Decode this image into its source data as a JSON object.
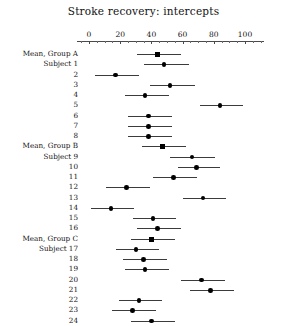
{
  "chart_data": {
    "type": "scatter",
    "title": "Stroke recovery: intercepts",
    "xlabel": "",
    "ylabel": "",
    "xlim": [
      -8,
      112
    ],
    "grid": false,
    "legend": null,
    "axis": {
      "ticks": [
        0,
        20,
        40,
        60,
        80,
        100
      ],
      "tick_labels": [
        "0",
        "20",
        "40",
        "60",
        "80",
        "100"
      ],
      "minor_tick_step": 5,
      "position": "top"
    },
    "marker_styles": {
      "mean": "square",
      "subject": "circle"
    },
    "rows": [
      {
        "label": "Mean, Group A",
        "type": "mean",
        "estimate": 44.0,
        "low": 31.0,
        "high": 59.0
      },
      {
        "label": "Subject 1",
        "type": "subject",
        "estimate": 48.0,
        "low": 35.0,
        "high": 64.0
      },
      {
        "label": "2",
        "type": "subject",
        "estimate": 17.0,
        "low": 4.0,
        "high": 32.0
      },
      {
        "label": "3",
        "type": "subject",
        "estimate": 52.0,
        "low": 39.0,
        "high": 68.0
      },
      {
        "label": "4",
        "type": "subject",
        "estimate": 36.0,
        "low": 23.0,
        "high": 51.0
      },
      {
        "label": "5",
        "type": "subject",
        "estimate": 84.0,
        "low": 71.0,
        "high": 99.0
      },
      {
        "label": "6",
        "type": "subject",
        "estimate": 38.0,
        "low": 25.0,
        "high": 53.0
      },
      {
        "label": "7",
        "type": "subject",
        "estimate": 38.0,
        "low": 25.0,
        "high": 53.0
      },
      {
        "label": "8",
        "type": "subject",
        "estimate": 38.0,
        "low": 25.0,
        "high": 53.0
      },
      {
        "label": "Mean, Group B",
        "type": "mean",
        "estimate": 47.0,
        "low": 34.0,
        "high": 62.0
      },
      {
        "label": "Subject 9",
        "type": "subject",
        "estimate": 66.0,
        "low": 52.0,
        "high": 81.0
      },
      {
        "label": "10",
        "type": "subject",
        "estimate": 69.0,
        "low": 57.0,
        "high": 84.0
      },
      {
        "label": "11",
        "type": "subject",
        "estimate": 54.0,
        "low": 41.0,
        "high": 69.0
      },
      {
        "label": "12",
        "type": "subject",
        "estimate": 24.0,
        "low": 11.0,
        "high": 39.0
      },
      {
        "label": "13",
        "type": "subject",
        "estimate": 73.0,
        "low": 60.0,
        "high": 88.0
      },
      {
        "label": "14",
        "type": "subject",
        "estimate": 14.0,
        "low": 1.0,
        "high": 29.0
      },
      {
        "label": "15",
        "type": "subject",
        "estimate": 41.0,
        "low": 28.0,
        "high": 56.0
      },
      {
        "label": "16",
        "type": "subject",
        "estimate": 44.0,
        "low": 31.0,
        "high": 59.0
      },
      {
        "label": "Mean, Group C",
        "type": "mean",
        "estimate": 40.0,
        "low": 27.0,
        "high": 55.0
      },
      {
        "label": "Subject 17",
        "type": "subject",
        "estimate": 30.0,
        "low": 17.0,
        "high": 45.0
      },
      {
        "label": "18",
        "type": "subject",
        "estimate": 35.0,
        "low": 22.0,
        "high": 50.0
      },
      {
        "label": "19",
        "type": "subject",
        "estimate": 36.0,
        "low": 23.0,
        "high": 51.0
      },
      {
        "label": "20",
        "type": "subject",
        "estimate": 72.0,
        "low": 59.0,
        "high": 87.0
      },
      {
        "label": "21",
        "type": "subject",
        "estimate": 78.0,
        "low": 65.0,
        "high": 93.0
      },
      {
        "label": "22",
        "type": "subject",
        "estimate": 32.0,
        "low": 19.0,
        "high": 47.0
      },
      {
        "label": "23",
        "type": "subject",
        "estimate": 28.0,
        "low": 15.0,
        "high": 43.0
      },
      {
        "label": "24",
        "type": "subject",
        "estimate": 40.0,
        "low": 27.0,
        "high": 55.0
      }
    ]
  }
}
